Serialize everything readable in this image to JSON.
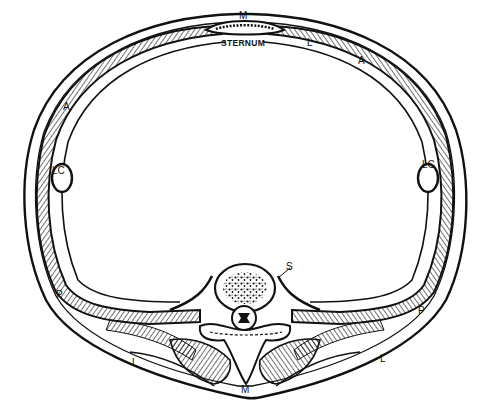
{
  "diagram": {
    "type": "anatomical cross-section (thorax)",
    "labels": {
      "sternum": "STERNUM",
      "m_top": "M",
      "m_bottom": "M",
      "l_top_right": "L",
      "l_bottom_left": "L",
      "l_bottom_right": "L",
      "a_left": "A",
      "a_right": "A",
      "lc_left": "LC",
      "lc_right": "LC",
      "p_left": "P",
      "p_right": "P",
      "s": "S"
    },
    "colors": {
      "ink": "#111111",
      "background": "#ffffff"
    }
  }
}
